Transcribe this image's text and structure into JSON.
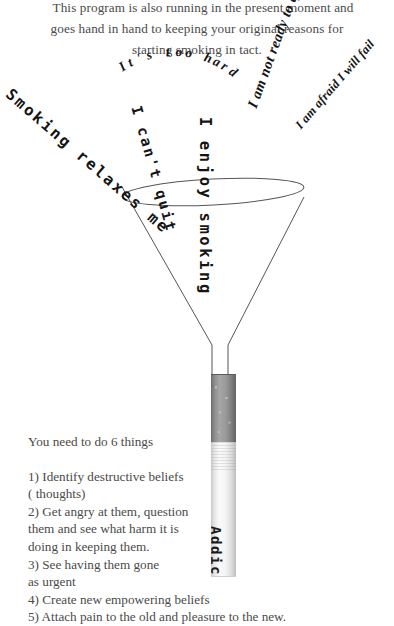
{
  "page": {
    "background_color": "#ffffff",
    "text_color": "#4a4a4a",
    "ink_color": "#141414"
  },
  "intro": {
    "line_1": "This program is also running in the present moment and",
    "line_2": "goes hand in hand to keeping your original reasons for",
    "line_3": "starting smoking in tact."
  },
  "funnel": {
    "caption": "funnel-diagram",
    "stroke_color": "#555555",
    "beliefs": [
      {
        "id": "smoking-relaxes",
        "text": "Smoking relaxes me",
        "style": "mono"
      },
      {
        "id": "cant-quit",
        "text": "I can't quit",
        "style": "mono"
      },
      {
        "id": "too-hard",
        "text": "It's too hard",
        "style": "serif-arc"
      },
      {
        "id": "enjoy-smoking",
        "text": "I enjoy smoking",
        "style": "mono"
      },
      {
        "id": "not-ready",
        "text": "I am not ready to quit",
        "style": "serif"
      },
      {
        "id": "afraid-fail",
        "text": "I am afraid I will fail",
        "style": "serif"
      }
    ]
  },
  "cigarette": {
    "label": "Addiction",
    "tobacco_color": "#8d8d8d",
    "paper_color": "#f4f4f4"
  },
  "instructions": {
    "heading": "You need to do 6 things",
    "steps": [
      "1) Identify destructive beliefs",
      "( thoughts)",
      "2) Get angry at them, question",
      "them and see what harm it is",
      "doing in keeping them.",
      "3) See having them gone",
      "as urgent",
      "4) Create new empowering beliefs",
      "5) Attach pain to the old and pleasure to the new."
    ]
  }
}
